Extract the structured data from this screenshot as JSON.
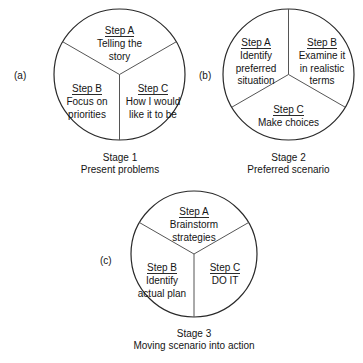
{
  "diagram": {
    "background_color": "#ffffff",
    "line_color": "#2a2a2a",
    "text_color": "#141414",
    "panels": [
      {
        "label": "(a)",
        "divider": "y-upright",
        "segments": [
          {
            "step": "Step A",
            "body_line1": "Telling the",
            "body_line2": "story"
          },
          {
            "step": "Step B",
            "body_line1": "Focus on",
            "body_line2": "priorities"
          },
          {
            "step": "Step C",
            "body_line1": "How I would",
            "body_line2": "like it to be"
          }
        ],
        "caption_line1": "Stage 1",
        "caption_line2": "Present problems"
      },
      {
        "label": "(b)",
        "divider": "y-inverted",
        "segments": [
          {
            "step": "Step A",
            "body_line1": "Identify",
            "body_line2": "preferred",
            "body_line3": "situation"
          },
          {
            "step": "Step B",
            "body_line1": "Examine it",
            "body_line2": "in realistic",
            "body_line3": "terms"
          },
          {
            "step": "Step C",
            "body_line1": "Make choices",
            "body_line2": "",
            "body_line3": ""
          }
        ],
        "caption_line1": "Stage 2",
        "caption_line2": "Preferred scenario"
      },
      {
        "label": "(c)",
        "divider": "y-upright",
        "segments": [
          {
            "step": "Step A",
            "body_line1": "Brainstorm",
            "body_line2": "strategies"
          },
          {
            "step": "Step B",
            "body_line1": "Identify",
            "body_line2": "actual plan"
          },
          {
            "step": "Step C",
            "body_line1": "DO IT",
            "body_line2": ""
          }
        ],
        "caption_line1": "Stage 3",
        "caption_line2": "Moving scenario into action"
      }
    ]
  }
}
